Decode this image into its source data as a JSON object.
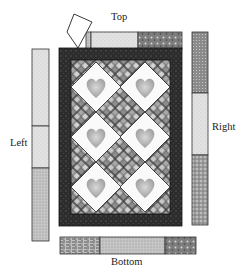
{
  "labels": {
    "top": "Top",
    "left": "Left",
    "right": "Right",
    "bottom": "Bottom"
  },
  "quilt": {
    "hearts": 6,
    "layout": "3 rows x 2 columns of on-point heart blocks with checkerboard setting squares",
    "border_color": "#2a2a2a"
  },
  "borders": {
    "top": {
      "segments": [
        "medium print",
        "light print",
        "dark print"
      ]
    },
    "left": {
      "segments": [
        "light print",
        "light speckle",
        "medium speckle"
      ]
    },
    "right": {
      "segments": [
        "dark dot",
        "light print",
        "dark speckle"
      ]
    },
    "bottom": {
      "segments": [
        "basketweave",
        "medium speckle",
        "dark print"
      ]
    }
  },
  "colors": {
    "light": "#e0e0e0",
    "medium": "#b8b8b8",
    "dark": "#6e6e6e",
    "border": "#2a2a2a",
    "outline": "#333333"
  }
}
